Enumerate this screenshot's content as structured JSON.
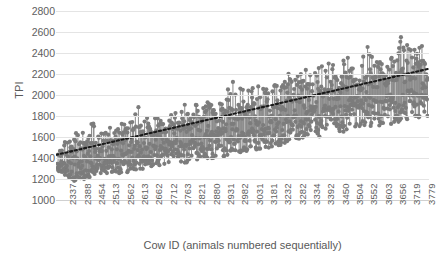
{
  "chart_data": {
    "type": "scatter",
    "title": "",
    "xlabel": "Cow ID (animals numbered sequentially)",
    "ylabel": "TPI",
    "ylim": [
      1000,
      2800
    ],
    "ytick_step": 200,
    "yticks": [
      "2800",
      "2600",
      "2400",
      "2200",
      "2000",
      "1800",
      "1600",
      "1400",
      "1200",
      "1000"
    ],
    "xticks": [
      "2337",
      "2388",
      "2454",
      "2513",
      "2562",
      "2613",
      "2662",
      "2712",
      "2763",
      "2821",
      "2880",
      "2931",
      "2982",
      "3031",
      "3181",
      "3232",
      "3282",
      "3334",
      "3392",
      "3450",
      "3504",
      "3552",
      "3603",
      "3656",
      "3719",
      "3779"
    ],
    "grid": true,
    "legend": "none",
    "marker_style": "lollipop-stem",
    "marker_color": "#7c7c7c",
    "stem_color": "#8a8a8a",
    "trendline": {
      "style": "dotted",
      "color": "#1a1a1a",
      "x_start_index": 0,
      "x_end_index": 599,
      "y_start": 1430,
      "y_end": 2250
    },
    "series": [
      {
        "name": "TPI by Cow ID",
        "n_points": 600,
        "x_range": [
          2337,
          3779
        ],
        "y_range_observed": [
          1150,
          2720
        ],
        "description": "Dense lollipop/stem scatter of individual cow TPI values rising across sequentially numbered animals; mean trend increases from about 1430 to about 2250.",
        "band_profile": [
          {
            "x_frac": 0.0,
            "low": 1280,
            "high": 1790,
            "mean": 1440
          },
          {
            "x_frac": 0.05,
            "low": 1170,
            "high": 1880,
            "mean": 1480
          },
          {
            "x_frac": 0.1,
            "low": 1230,
            "high": 1960,
            "mean": 1520
          },
          {
            "x_frac": 0.15,
            "low": 1250,
            "high": 1990,
            "mean": 1560
          },
          {
            "x_frac": 0.2,
            "low": 1260,
            "high": 2030,
            "mean": 1600
          },
          {
            "x_frac": 0.25,
            "low": 1300,
            "high": 2020,
            "mean": 1640
          },
          {
            "x_frac": 0.3,
            "low": 1330,
            "high": 2100,
            "mean": 1690
          },
          {
            "x_frac": 0.35,
            "low": 1340,
            "high": 2180,
            "mean": 1730
          },
          {
            "x_frac": 0.4,
            "low": 1360,
            "high": 2230,
            "mean": 1780
          },
          {
            "x_frac": 0.45,
            "low": 1390,
            "high": 2290,
            "mean": 1820
          },
          {
            "x_frac": 0.5,
            "low": 1420,
            "high": 2330,
            "mean": 1860
          },
          {
            "x_frac": 0.55,
            "low": 1430,
            "high": 2380,
            "mean": 1910
          },
          {
            "x_frac": 0.6,
            "low": 1460,
            "high": 2420,
            "mean": 1950
          },
          {
            "x_frac": 0.65,
            "low": 1500,
            "high": 2470,
            "mean": 2000
          },
          {
            "x_frac": 0.7,
            "low": 1520,
            "high": 2500,
            "mean": 2040
          },
          {
            "x_frac": 0.75,
            "low": 1540,
            "high": 2530,
            "mean": 2080
          },
          {
            "x_frac": 0.8,
            "low": 1560,
            "high": 2580,
            "mean": 2120
          },
          {
            "x_frac": 0.85,
            "low": 1590,
            "high": 2620,
            "mean": 2160
          },
          {
            "x_frac": 0.9,
            "low": 1620,
            "high": 2660,
            "mean": 2190
          },
          {
            "x_frac": 0.95,
            "low": 1660,
            "high": 2700,
            "mean": 2230
          },
          {
            "x_frac": 1.0,
            "low": 1700,
            "high": 2720,
            "mean": 2250
          }
        ]
      }
    ]
  }
}
